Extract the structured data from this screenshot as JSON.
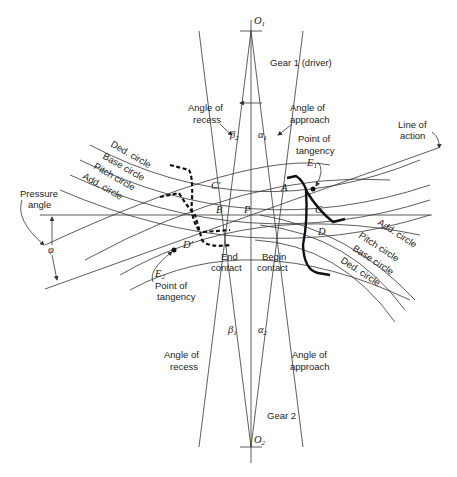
{
  "diagram": {
    "centers": {
      "top": "O",
      "top_sub": "1",
      "bottom": "O",
      "bottom_sub": "2"
    },
    "gear1_label": "Gear 1 (driver)",
    "gear2_label": "Gear 2",
    "top_angles": {
      "recess_label_line1": "Angle of",
      "recess_label_line2": "recess",
      "approach_label_line1": "Angle of",
      "approach_label_line2": "approach",
      "beta": "β",
      "beta_sub": "2",
      "alpha": "α",
      "alpha_sub": "1"
    },
    "bottom_angles": {
      "recess_label_line1": "Angle of",
      "recess_label_line2": "recess",
      "approach_label_line1": "Angle of",
      "approach_label_line2": "approach",
      "beta": "β",
      "beta_sub": "1",
      "alpha": "α",
      "alpha_sub": "2"
    },
    "tangency_top": {
      "line1": "Point of",
      "line2": "tangency",
      "point": "E",
      "point_sub": "1"
    },
    "tangency_bottom": {
      "line1": "Point of",
      "line2": "tangency",
      "point": "E",
      "point_sub": "2"
    },
    "line_of_action": {
      "line1": "Line of",
      "line2": "action"
    },
    "pressure_angle": {
      "line1": "Pressure",
      "line2": "angle",
      "symbol": "φ"
    },
    "left_circles": [
      "Ded. circle",
      "Base circle",
      "Pitch circle",
      "Add. circle"
    ],
    "right_circles": [
      "Add. circle",
      "Pitch circle",
      "Base circle",
      "Ded. circle"
    ],
    "points": {
      "A": "A",
      "B": "B",
      "C": "C",
      "Cp": "C′",
      "D": "D",
      "Dp": "D′",
      "P": "P"
    },
    "end_contact": {
      "line1": "End",
      "line2": "contact"
    },
    "begin_contact": {
      "line1": "Begin",
      "line2": "contact"
    }
  }
}
